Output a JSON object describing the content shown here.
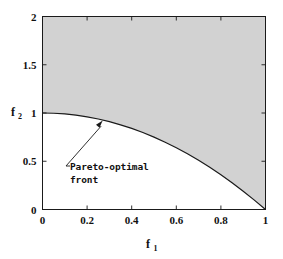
{
  "chart_data": {
    "type": "line",
    "title": "",
    "xlabel": "f_1",
    "ylabel": "f_2",
    "xlabel_base": "f",
    "xlabel_sub": "1",
    "ylabel_base": "f",
    "ylabel_sub": "2",
    "xlim": [
      0,
      1
    ],
    "ylim": [
      0,
      2
    ],
    "grid": false,
    "legend": "none",
    "x_ticks": [
      0,
      0.2,
      0.4,
      0.6,
      0.8,
      1
    ],
    "x_tick_labels": [
      "0",
      "0.2",
      "0.4",
      "0.6",
      "0.8",
      "1"
    ],
    "y_ticks": [
      0,
      0.5,
      1,
      1.5,
      2
    ],
    "y_tick_labels": [
      "0",
      "0.5",
      "1",
      "1.5",
      "2"
    ],
    "series": [
      {
        "name": "Pareto-optimal front",
        "relation": "f2 = 1 - f1^2",
        "x": [
          0,
          0.05,
          0.1,
          0.15,
          0.2,
          0.25,
          0.3,
          0.35,
          0.4,
          0.45,
          0.5,
          0.55,
          0.6,
          0.65,
          0.7,
          0.75,
          0.8,
          0.85,
          0.9,
          0.95,
          1
        ],
        "values": [
          1,
          0.9975,
          0.99,
          0.9775,
          0.96,
          0.9375,
          0.91,
          0.8775,
          0.84,
          0.7975,
          0.75,
          0.6975,
          0.64,
          0.5775,
          0.51,
          0.4375,
          0.36,
          0.2775,
          0.19,
          0.0975,
          0
        ]
      }
    ],
    "shaded_region": {
      "name": "feasible-objective-region",
      "description": "Region above and right of the Pareto-optimal front up to f2 = 2",
      "color": "#d2d2d2"
    },
    "annotations": [
      {
        "name": "pareto-optimal-front",
        "line1": "Pareto-optimal",
        "line2": "front",
        "points_to_x": 0.27,
        "points_to_y": 0.927
      }
    ],
    "colors": {
      "curve": "#1a1a1a",
      "axis": "#1a1a1a",
      "shaded": "#d2d2d2",
      "background": "#ffffff",
      "text": "#111111"
    }
  }
}
